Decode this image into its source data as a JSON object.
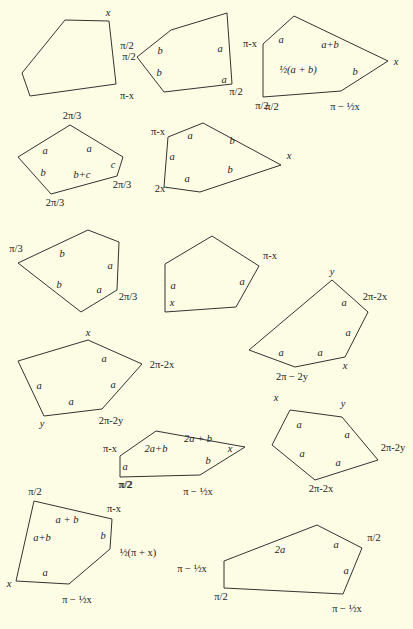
{
  "colors": {
    "background": "#fdfde6",
    "stroke": "#333333",
    "text": "#222222"
  },
  "pentagons": [
    {
      "id": "p1",
      "points": [
        [
          22,
          73
        ],
        [
          65,
          20
        ],
        [
          109,
          21
        ],
        [
          116,
          84
        ],
        [
          30,
          96
        ]
      ],
      "labels": [
        {
          "t": "x",
          "x": 108,
          "y": 13,
          "it": true
        },
        {
          "t": "π/2",
          "x": 129,
          "y": 57
        },
        {
          "t": "π-x",
          "x": 127,
          "y": 96
        }
      ]
    },
    {
      "id": "p2",
      "points": [
        [
          137,
          57
        ],
        [
          171,
          30
        ],
        [
          227,
          13
        ],
        [
          232,
          84
        ],
        [
          164,
          92
        ]
      ],
      "labels": [
        {
          "t": "π/2",
          "x": 127,
          "y": 46
        },
        {
          "t": "b",
          "x": 160,
          "y": 51,
          "it": true
        },
        {
          "t": "a",
          "x": 220,
          "y": 49,
          "it": true
        },
        {
          "t": "b",
          "x": 159,
          "y": 73,
          "it": true
        },
        {
          "t": "a",
          "x": 224,
          "y": 80,
          "it": true
        },
        {
          "t": "π/2",
          "x": 236,
          "y": 92
        }
      ]
    },
    {
      "id": "p3",
      "points": [
        [
          263,
          44
        ],
        [
          294,
          16
        ],
        [
          388,
          61
        ],
        [
          341,
          91
        ],
        [
          263,
          97
        ]
      ],
      "labels": [
        {
          "t": "π-x",
          "x": 250,
          "y": 44
        },
        {
          "t": "a",
          "x": 281,
          "y": 40,
          "it": true
        },
        {
          "t": "a+b",
          "x": 330,
          "y": 45,
          "it": true
        },
        {
          "t": "x",
          "x": 396,
          "y": 62,
          "it": true
        },
        {
          "t": "½(a + b)",
          "x": 298,
          "y": 70,
          "it": true
        },
        {
          "t": "b",
          "x": 355,
          "y": 72,
          "it": true
        },
        {
          "t": "π/2",
          "x": 262,
          "y": 106
        },
        {
          "t": "π −  ½x",
          "x": 345,
          "y": 107
        }
      ]
    },
    {
      "id": "p4",
      "points": [
        [
          18,
          157
        ],
        [
          70,
          125
        ],
        [
          123,
          157
        ],
        [
          117,
          176
        ],
        [
          51,
          194
        ]
      ],
      "labels": [
        {
          "t": "2π/3",
          "x": 72,
          "y": 116
        },
        {
          "t": "a",
          "x": 45,
          "y": 151,
          "it": true
        },
        {
          "t": "a",
          "x": 89,
          "y": 149,
          "it": true
        },
        {
          "t": "c",
          "x": 113,
          "y": 165,
          "it": true
        },
        {
          "t": "b",
          "x": 43,
          "y": 173,
          "it": true
        },
        {
          "t": "b+c",
          "x": 82,
          "y": 175,
          "it": true
        },
        {
          "t": "2π/3",
          "x": 122,
          "y": 185
        },
        {
          "t": "2π/3",
          "x": 55,
          "y": 203
        }
      ]
    },
    {
      "id": "p5",
      "points": [
        [
          168,
          137
        ],
        [
          203,
          123
        ],
        [
          281,
          165
        ],
        [
          200,
          192
        ],
        [
          164,
          187
        ]
      ],
      "labels": [
        {
          "t": "π/2",
          "x": 272,
          "y": 107
        },
        {
          "t": "π-x",
          "x": 158,
          "y": 132
        },
        {
          "t": "a",
          "x": 190,
          "y": 136,
          "it": true
        },
        {
          "t": "b",
          "x": 232,
          "y": 141,
          "it": true
        },
        {
          "t": "x",
          "x": 289,
          "y": 156,
          "it": true
        },
        {
          "t": "a",
          "x": 172,
          "y": 157,
          "it": true
        },
        {
          "t": "b",
          "x": 230,
          "y": 170,
          "it": true
        },
        {
          "t": "a",
          "x": 187,
          "y": 179,
          "it": true
        },
        {
          "t": "2x",
          "x": 160,
          "y": 189
        }
      ]
    },
    {
      "id": "p6",
      "points": [
        [
          18,
          263
        ],
        [
          88,
          230
        ],
        [
          119,
          242
        ],
        [
          117,
          290
        ],
        [
          81,
          312
        ]
      ],
      "labels": [
        {
          "t": "π/3",
          "x": 16,
          "y": 249
        },
        {
          "t": "b",
          "x": 62,
          "y": 254,
          "it": true
        },
        {
          "t": "a",
          "x": 110,
          "y": 266,
          "it": true
        },
        {
          "t": "b",
          "x": 59,
          "y": 285,
          "it": true
        },
        {
          "t": "a",
          "x": 99,
          "y": 290,
          "it": true
        },
        {
          "t": "2π/3",
          "x": 128,
          "y": 297
        }
      ]
    },
    {
      "id": "p7",
      "points": [
        [
          165,
          264
        ],
        [
          212,
          236
        ],
        [
          259,
          266
        ],
        [
          236,
          307
        ],
        [
          165,
          312
        ]
      ],
      "labels": [
        {
          "t": "π-x",
          "x": 270,
          "y": 256
        },
        {
          "t": "a",
          "x": 173,
          "y": 286,
          "it": true
        },
        {
          "t": "a",
          "x": 242,
          "y": 282,
          "it": true
        },
        {
          "t": "x",
          "x": 172,
          "y": 303,
          "it": true
        }
      ]
    },
    {
      "id": "p8",
      "points": [
        [
          249,
          350
        ],
        [
          332,
          280
        ],
        [
          368,
          312
        ],
        [
          345,
          357
        ],
        [
          295,
          367
        ]
      ],
      "labels": [
        {
          "t": "y",
          "x": 332,
          "y": 272,
          "it": true
        },
        {
          "t": "2π-2x",
          "x": 375,
          "y": 297
        },
        {
          "t": "a",
          "x": 344,
          "y": 303,
          "it": true
        },
        {
          "t": "a",
          "x": 348,
          "y": 333,
          "it": true
        },
        {
          "t": "a",
          "x": 281,
          "y": 353,
          "it": true
        },
        {
          "t": "a",
          "x": 320,
          "y": 353,
          "it": true
        },
        {
          "t": "x",
          "x": 345,
          "y": 366,
          "it": true
        },
        {
          "t": "2π − 2y",
          "x": 292,
          "y": 377
        }
      ]
    },
    {
      "id": "p9",
      "points": [
        [
          18,
          361
        ],
        [
          88,
          340
        ],
        [
          142,
          364
        ],
        [
          102,
          409
        ],
        [
          44,
          416
        ]
      ],
      "labels": [
        {
          "t": "x",
          "x": 88,
          "y": 333,
          "it": true
        },
        {
          "t": "a",
          "x": 104,
          "y": 359,
          "it": true
        },
        {
          "t": "2π-2x",
          "x": 162,
          "y": 365
        },
        {
          "t": "a",
          "x": 39,
          "y": 386,
          "it": true
        },
        {
          "t": "a",
          "x": 113,
          "y": 385,
          "it": true
        },
        {
          "t": "a",
          "x": 71,
          "y": 402,
          "it": true
        },
        {
          "t": "2π-2y",
          "x": 111,
          "y": 421
        },
        {
          "t": "y",
          "x": 42,
          "y": 424,
          "it": true
        }
      ]
    },
    {
      "id": "p10",
      "points": [
        [
          120,
          456
        ],
        [
          156,
          431
        ],
        [
          245,
          447
        ],
        [
          200,
          475
        ],
        [
          120,
          477
        ]
      ],
      "labels": [
        {
          "t": "π-x",
          "x": 110,
          "y": 449
        },
        {
          "t": "2a+b",
          "x": 156,
          "y": 449,
          "it": true
        },
        {
          "t": "2a + b",
          "x": 198,
          "y": 439,
          "it": true
        },
        {
          "t": "x",
          "x": 230,
          "y": 449,
          "it": true
        },
        {
          "t": "b",
          "x": 208,
          "y": 461,
          "it": true
        },
        {
          "t": "a",
          "x": 125,
          "y": 467,
          "it": true
        },
        {
          "t": "π/2",
          "x": 125,
          "y": 485
        },
        {
          "t": "π −  ½x",
          "x": 198,
          "y": 492
        }
      ]
    },
    {
      "id": "p11",
      "points": [
        [
          272,
          445
        ],
        [
          290,
          410
        ],
        [
          342,
          417
        ],
        [
          378,
          460
        ],
        [
          315,
          480
        ]
      ],
      "labels": [
        {
          "t": "x",
          "x": 276,
          "y": 398,
          "it": true
        },
        {
          "t": "y",
          "x": 343,
          "y": 404,
          "it": true
        },
        {
          "t": "a",
          "x": 299,
          "y": 425,
          "it": true
        },
        {
          "t": "a",
          "x": 347,
          "y": 435,
          "it": true
        },
        {
          "t": "2π-2y",
          "x": 393,
          "y": 448
        },
        {
          "t": "a",
          "x": 302,
          "y": 454,
          "it": true
        },
        {
          "t": "a",
          "x": 338,
          "y": 463,
          "it": true
        },
        {
          "t": "2π-2x",
          "x": 321,
          "y": 489
        }
      ]
    },
    {
      "id": "p12",
      "points": [
        [
          34,
          501
        ],
        [
          112,
          519
        ],
        [
          110,
          549
        ],
        [
          69,
          584
        ],
        [
          16,
          581
        ]
      ],
      "labels": [
        {
          "t": "π/2",
          "x": 35,
          "y": 492
        },
        {
          "t": "π/2",
          "x": 126,
          "y": 485
        },
        {
          "t": "π-x",
          "x": 114,
          "y": 509
        },
        {
          "t": "a + b",
          "x": 67,
          "y": 520,
          "it": true
        },
        {
          "t": "a+b",
          "x": 42,
          "y": 538,
          "it": true
        },
        {
          "t": "b",
          "x": 103,
          "y": 536,
          "it": true
        },
        {
          "t": "½(π + x)",
          "x": 138,
          "y": 553
        },
        {
          "t": "a",
          "x": 45,
          "y": 573,
          "it": true
        },
        {
          "t": "x",
          "x": 9,
          "y": 584,
          "it": true
        },
        {
          "t": "π −  ½x",
          "x": 77,
          "y": 600
        }
      ]
    },
    {
      "id": "p13",
      "points": [
        [
          224,
          561
        ],
        [
          317,
          525
        ],
        [
          362,
          548
        ],
        [
          343,
          594
        ],
        [
          224,
          588
        ]
      ],
      "labels": [
        {
          "t": "π/2",
          "x": 374,
          "y": 538
        },
        {
          "t": "2a",
          "x": 280,
          "y": 550,
          "it": true
        },
        {
          "t": "a",
          "x": 336,
          "y": 545,
          "it": true
        },
        {
          "t": "π −  ½x",
          "x": 192,
          "y": 569
        },
        {
          "t": "a",
          "x": 346,
          "y": 571,
          "it": true
        },
        {
          "t": "π/2",
          "x": 221,
          "y": 597
        },
        {
          "t": "π −  ½x",
          "x": 347,
          "y": 609
        }
      ]
    }
  ]
}
